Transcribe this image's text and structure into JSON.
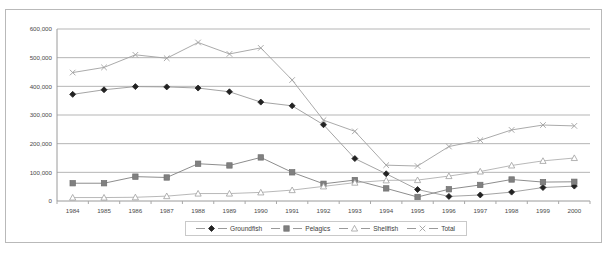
{
  "chart_data": {
    "type": "line",
    "title": "",
    "xlabel": "",
    "ylabel": "",
    "x": [
      1984,
      1985,
      1986,
      1987,
      1988,
      1989,
      1990,
      1991,
      1992,
      1993,
      1994,
      1995,
      1996,
      1997,
      1998,
      1999,
      2000
    ],
    "categories": [
      "1984",
      "1985",
      "1986",
      "1987",
      "1988",
      "1989",
      "1990",
      "1991",
      "1992",
      "1993",
      "1994",
      "1995",
      "1996",
      "1997",
      "1998",
      "1999",
      "2000"
    ],
    "ylim": [
      0,
      600000
    ],
    "ytick_values": [
      0,
      100000,
      200000,
      300000,
      400000,
      500000,
      600000
    ],
    "ytick_labels": [
      "0",
      "100,000",
      "200,000",
      "300,000",
      "400,000",
      "500,000",
      "600,000"
    ],
    "grid": true,
    "legend_position": "bottom",
    "series": [
      {
        "name": "Groundfish",
        "marker": "diamond",
        "color": "#222222",
        "values": [
          372000,
          388000,
          399000,
          398000,
          394000,
          381000,
          345000,
          332000,
          266000,
          148000,
          95000,
          40000,
          16000,
          21000,
          31000,
          47000,
          52000
        ]
      },
      {
        "name": "Pelagics",
        "marker": "square",
        "color": "#808080",
        "values": [
          62000,
          62000,
          85000,
          82000,
          130000,
          124000,
          152000,
          100000,
          60000,
          73000,
          44000,
          14000,
          41000,
          56000,
          75000,
          66000,
          67000
        ]
      },
      {
        "name": "Shellfish",
        "marker": "triangle",
        "color": "#b0b0b0",
        "values": [
          12000,
          12000,
          13000,
          17000,
          26000,
          26000,
          30000,
          38000,
          51000,
          64000,
          72000,
          73000,
          87000,
          103000,
          124000,
          140000,
          150000
        ]
      },
      {
        "name": "Total",
        "marker": "cross",
        "color": "#a0a0a0",
        "values": [
          448000,
          466000,
          510000,
          498000,
          553000,
          513000,
          534000,
          422000,
          282000,
          243000,
          125000,
          122000,
          190000,
          212000,
          248000,
          265000,
          262000
        ]
      }
    ]
  },
  "legend": {
    "items": [
      {
        "label": "Groundfish"
      },
      {
        "label": "Pelagics"
      },
      {
        "label": "Shellfish"
      },
      {
        "label": "Total"
      }
    ]
  }
}
